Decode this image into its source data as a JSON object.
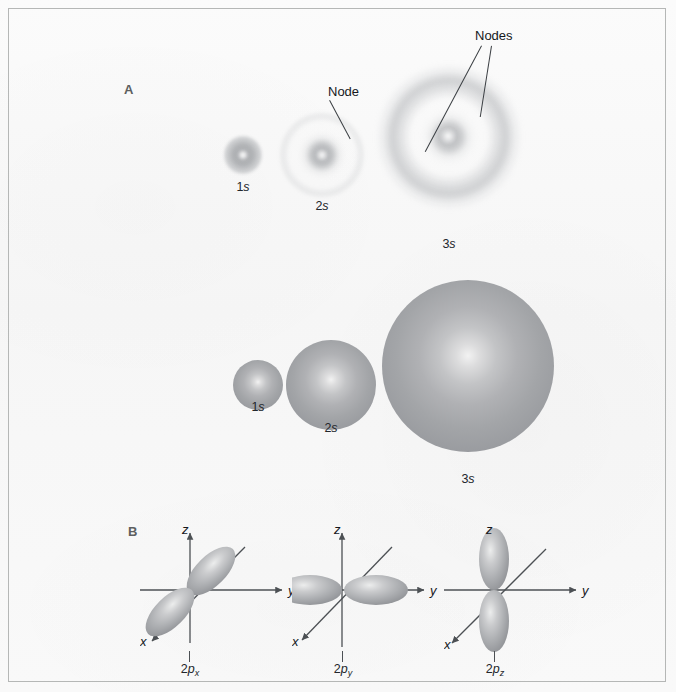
{
  "figure": {
    "background_color": "#fafafa",
    "border_color": "#b5b7b6"
  },
  "panels": [
    {
      "id": "A",
      "letter": "A",
      "caption": "electron probability density and boundary-surface s orbitals"
    },
    {
      "id": "B",
      "letter": "B",
      "caption": "2p orbitals"
    }
  ],
  "callouts": [
    {
      "name": "node-callout",
      "text": "Node",
      "target": "2s nodal region"
    },
    {
      "name": "nodes-callout",
      "text": "Nodes",
      "target": "3s nodal regions"
    }
  ],
  "cloud_orbitals": [
    {
      "name": "1s-cloud",
      "label": "1",
      "italic": "s",
      "radial_nodes": 0,
      "diameter_px": 36
    },
    {
      "name": "2s-cloud",
      "label": "2",
      "italic": "s",
      "radial_nodes": 1,
      "diameter_px": 78
    },
    {
      "name": "3s-cloud",
      "label": "3",
      "italic": "s",
      "radial_nodes": 2,
      "diameter_px": 140
    }
  ],
  "sphere_orbitals": [
    {
      "name": "1s-sphere",
      "label": "1",
      "italic": "s",
      "diameter_px": 48
    },
    {
      "name": "2s-sphere",
      "label": "2",
      "italic": "s",
      "diameter_px": 88
    },
    {
      "name": "3s-sphere",
      "label": "3",
      "italic": "s",
      "diameter_px": 170
    }
  ],
  "p_orbitals": [
    {
      "name": "2px",
      "prefix": "2",
      "symbol": "p",
      "subscript": "x",
      "orientation": "along x axis (diagonal, lower-left to upper-right)",
      "axes": [
        "x",
        "y",
        "z"
      ]
    },
    {
      "name": "2py",
      "prefix": "2",
      "symbol": "p",
      "subscript": "y",
      "orientation": "along y axis (horizontal)",
      "axes": [
        "x",
        "y",
        "z"
      ]
    },
    {
      "name": "2pz",
      "prefix": "2",
      "symbol": "p",
      "subscript": "z",
      "orientation": "along z axis (vertical)",
      "axes": [
        "x",
        "y",
        "z"
      ]
    }
  ],
  "axis_labels": {
    "x": "x",
    "y": "y",
    "z": "z"
  },
  "colors": {
    "cloud_gray": "#93969a",
    "sphere_gray": "#a3a5a8",
    "axis": "#4c5054",
    "text": "#15181c",
    "panel_letter": "#5d5f60"
  }
}
